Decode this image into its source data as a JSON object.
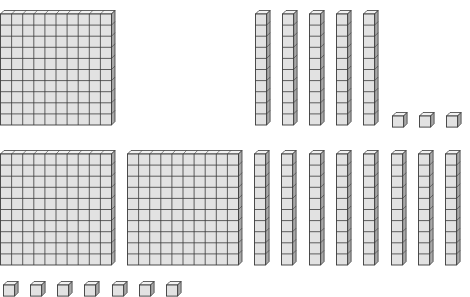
{
  "diagram": {
    "colors": {
      "face": "#e2e2e2",
      "top": "#f2f2f2",
      "side": "#a8a8a8",
      "line": "#3a3a3a"
    },
    "groups": [
      {
        "name": "top-number",
        "hundreds": 1,
        "tens": 5,
        "ones": 3,
        "flats": [
          {
            "x": 0,
            "y": 10
          }
        ],
        "rods": [
          {
            "x": 255,
            "y": 10
          },
          {
            "x": 282,
            "y": 10
          },
          {
            "x": 309,
            "y": 10
          },
          {
            "x": 336,
            "y": 10
          },
          {
            "x": 363,
            "y": 10
          }
        ],
        "units": [
          {
            "x": 391,
            "y": 112
          },
          {
            "x": 418,
            "y": 112
          },
          {
            "x": 445,
            "y": 112
          }
        ]
      },
      {
        "name": "bottom-number",
        "hundreds": 2,
        "tens": 8,
        "ones": 7,
        "flats": [
          {
            "x": 0,
            "y": 150
          },
          {
            "x": 127,
            "y": 150
          }
        ],
        "rods": [
          {
            "x": 254,
            "y": 150
          },
          {
            "x": 281,
            "y": 150
          },
          {
            "x": 309,
            "y": 150
          },
          {
            "x": 336,
            "y": 150
          },
          {
            "x": 363,
            "y": 150
          },
          {
            "x": 391,
            "y": 150
          },
          {
            "x": 418,
            "y": 150
          },
          {
            "x": 445,
            "y": 150
          }
        ],
        "units": [
          {
            "x": 2,
            "y": 281
          },
          {
            "x": 29,
            "y": 281
          },
          {
            "x": 56,
            "y": 281
          },
          {
            "x": 83,
            "y": 281
          },
          {
            "x": 111,
            "y": 281
          },
          {
            "x": 138,
            "y": 281
          },
          {
            "x": 165,
            "y": 281
          }
        ]
      }
    ]
  }
}
